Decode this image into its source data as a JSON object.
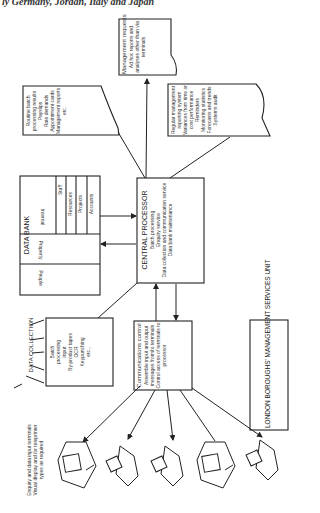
{
  "caption_top": "ly Germany, Jordan, Italy and Japan",
  "diagram": {
    "title": "LONDON BOROUGHS' MANAGEMENT SERVICES UNIT",
    "central_processor": {
      "heading": "CENTRAL PROCESSOR",
      "items": [
        "Batch processing",
        "Enquiry service",
        "Data collection and communication service",
        "Data bank maintenance"
      ]
    },
    "data_bank": {
      "heading": "DATA BANK",
      "sections": [
        "People",
        "Property",
        "Internal"
      ],
      "internal_items": [
        "Staff",
        "Resources",
        "Projects",
        "Accounts"
      ]
    },
    "data_collection": {
      "heading": "DATA COLLECTION",
      "items": [
        "Batch",
        "processing",
        "input",
        "By-product tapes",
        "OCR",
        "Keypunching",
        "etc.,"
      ]
    },
    "communications_control": {
      "heading": "Communications control",
      "items": [
        "Assemble input and output messages from/to terminals",
        "Control access of terminals to processor"
      ]
    },
    "routine_batch": {
      "heading": "Routine batch processing results",
      "items": [
        "Payslips",
        "Rate demands",
        "Appointment cards",
        "Management reports",
        "etc."
      ]
    },
    "management_requests": {
      "heading": "Management requests",
      "items": [
        "Ad hoc reports and analyses other than via terminals"
      ]
    },
    "regular_reporting": {
      "heading": "Regular management reporting system",
      "items": [
        "Variances from time or cost performance",
        "Reminders",
        "Monitoring statistics",
        "Forecasts and trends",
        "Systems audit"
      ]
    },
    "terminals": {
      "label": "Enquiry and data input terminals",
      "sublabel": "Visual display and /or teleprinter types as required",
      "types": [
        "visual-display",
        "teleprinter",
        "teleprinter",
        "visual-display",
        "teleprinter"
      ]
    }
  }
}
